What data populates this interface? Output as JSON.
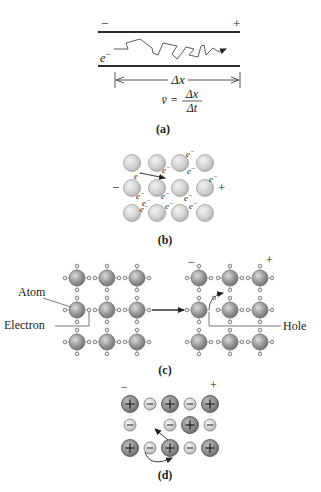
{
  "colors": {
    "line": "#2a2a2a",
    "gray_line": "#707070",
    "atom_fill": "#8f8f8f",
    "atom_light": "#d8d8d8",
    "neg_ion_fill": "#d4d4d4",
    "pos_ion_fill": "#8a8a8a"
  },
  "panel_a": {
    "minus": "−",
    "plus": "+",
    "electron": "e",
    "electron_sup": "−",
    "delta_x": "Δx",
    "formula_lhs": "v̄ =",
    "formula_num": "Δx",
    "formula_den": "Δt",
    "label": "(a)"
  },
  "panel_b": {
    "minus": "−",
    "plus": "+",
    "electron": "e",
    "electron_sup": "−",
    "label": "(b)"
  },
  "panel_c": {
    "atom_label": "Atom",
    "electron_label": "Electron",
    "hole_label": "Hole",
    "minus": "−",
    "plus": "+",
    "label": "(c)"
  },
  "panel_d": {
    "minus": "−",
    "plus": "+",
    "pos_sign": "+",
    "neg_sign": "−",
    "label": "(d)"
  }
}
